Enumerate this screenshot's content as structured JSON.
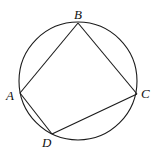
{
  "diagram": {
    "type": "cyclic-quadrilateral",
    "circle": {
      "cx": 78,
      "cy": 81,
      "r": 59
    },
    "points": [
      {
        "name": "A",
        "x": 20,
        "y": 93,
        "label_x": 6,
        "label_y": 100
      },
      {
        "name": "B",
        "x": 78,
        "y": 23,
        "label_x": 74,
        "label_y": 19
      },
      {
        "name": "C",
        "x": 137,
        "y": 94,
        "label_x": 141,
        "label_y": 98
      },
      {
        "name": "D",
        "x": 52,
        "y": 134,
        "label_x": 42,
        "label_y": 147
      }
    ],
    "segments": [
      "AB",
      "BC",
      "CD",
      "DA"
    ],
    "colors": {
      "stroke": "#1a1a1a",
      "background": "#ffffff"
    }
  }
}
